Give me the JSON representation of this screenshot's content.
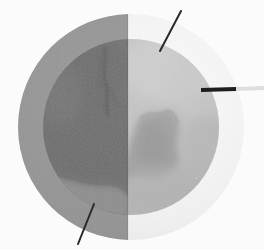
{
  "figure": {
    "width_px": 264,
    "height_px": 249,
    "background_color": "#fbfbfb"
  },
  "specimen": {
    "label": "specimen-disc",
    "center_x": 131,
    "center_y": 127,
    "outer_radius": 113,
    "inner_radius": 88,
    "split_x": 128,
    "split_orientation": "vertical",
    "halves": [
      {
        "name": "left-half",
        "label": "Left half (low window)",
        "outer_ring_color": "#909090",
        "inner_core_color": "#6b6b6b",
        "inner_core_color_light": "#7e7e7e"
      },
      {
        "name": "right-half",
        "label": "Right half (high window)",
        "outer_ring_color": "#f0f0f0",
        "inner_core_color": "#b6b6b6",
        "inner_core_color_light": "#c8c8c8"
      }
    ],
    "features": [
      {
        "name": "vein-fracture",
        "label": "Dark vein / fracture",
        "position": "upper-center",
        "color": "#4f4f4f"
      },
      {
        "name": "inclusion-blob",
        "label": "Irregular inclusion",
        "position": "center-right",
        "color": "#9a9a9a"
      },
      {
        "name": "lower-band",
        "label": "Lighter basal band",
        "position": "lower-left",
        "color": "#8a8a8a"
      }
    ]
  },
  "annotations": {
    "markers": [
      {
        "name": "marker-top-right",
        "label": "Top-right diagonal marker",
        "type": "line",
        "x1": 181,
        "y1": 11,
        "x2": 160,
        "y2": 51,
        "color": "#2a2a2a",
        "width": 2
      },
      {
        "name": "marker-right-horizontal",
        "label": "Right horizontal bar marker",
        "type": "line",
        "x1": 201,
        "y1": 90,
        "x2": 236,
        "y2": 89,
        "color": "#1e1e1e",
        "width": 4
      },
      {
        "name": "marker-right-extension",
        "label": "Right bar pale extension",
        "type": "line",
        "x1": 236,
        "y1": 89,
        "x2": 264,
        "y2": 88,
        "color": "#dedede",
        "width": 4
      },
      {
        "name": "marker-bottom-left",
        "label": "Bottom-left diagonal marker",
        "type": "line",
        "x1": 94,
        "y1": 204,
        "x2": 78,
        "y2": 244,
        "color": "#2a2a2a",
        "width": 2
      }
    ]
  }
}
